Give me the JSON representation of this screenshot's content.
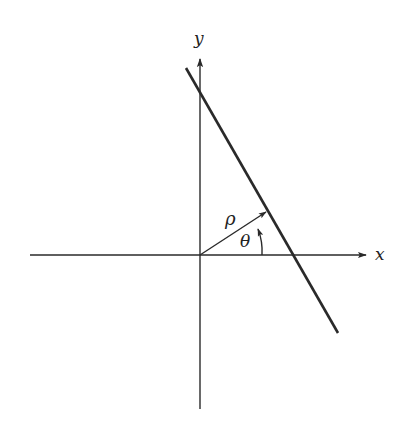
{
  "diagram": {
    "type": "hough-line-normal-parameterization",
    "axes": {
      "x_label": "x",
      "y_label": "y",
      "origin": [
        200,
        255
      ],
      "x_axis": {
        "from": [
          30,
          255
        ],
        "to": [
          368,
          255
        ]
      },
      "y_axis": {
        "from": [
          200,
          409
        ],
        "to": [
          200,
          57
        ]
      }
    },
    "line": {
      "from": [
        186,
        68
      ],
      "to": [
        338,
        333
      ]
    },
    "rho_vector": {
      "label": "ρ",
      "from": [
        200,
        255
      ],
      "to": [
        267,
        212
      ]
    },
    "theta_arc": {
      "label": "θ",
      "radius": 62
    },
    "colors": {
      "stroke": "#2a2a2a",
      "background": "#ffffff"
    }
  }
}
